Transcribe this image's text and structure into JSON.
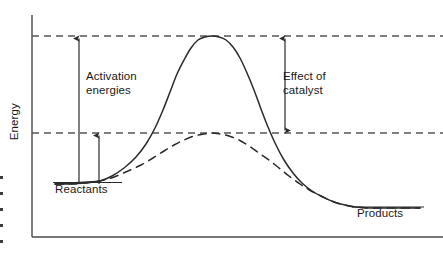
{
  "figure": {
    "kind": "reaction-energy-profile-diagram",
    "background": "#ffffff",
    "stroke_color": "#2b2b2b",
    "dash_color": "#555555"
  },
  "axes": {
    "y_label": "Energy",
    "x_label": "",
    "y_axis_x": 32,
    "y_axis_top": 15,
    "x_axis_y": 237,
    "x_axis_right": 443,
    "ticks": []
  },
  "labels": {
    "activation_energies": "Activation\nenergies",
    "effect_of_catalyst": "Effect of\ncatalyst",
    "reactants": "Reactants",
    "products": "Products",
    "energy": "Energy"
  },
  "levels": {
    "transition_state_uncatalyzed_y": 36,
    "transition_state_catalyzed_y": 133,
    "reactants_y": 184,
    "products_y": 208
  },
  "arrows": [
    {
      "name": "activation-energy-uncatalyzed-arrow",
      "x": 79,
      "y_from": 184,
      "y_to": 36,
      "heads": "up"
    },
    {
      "name": "activation-energy-catalyzed-arrow",
      "x": 99,
      "y_from": 184,
      "y_to": 133,
      "heads": "up"
    },
    {
      "name": "effect-of-catalyst-arrow",
      "x": 285,
      "y_from": 36,
      "y_to": 133,
      "heads": "both"
    }
  ],
  "chart_data": {
    "type": "line",
    "title": "",
    "xlabel": "",
    "ylabel": "Energy",
    "grid": false,
    "legend": null,
    "xlim": [
      32,
      443
    ],
    "ylim_pixels_top_to_bottom": [
      15,
      237
    ],
    "annotations": [
      {
        "text": "Activation energies",
        "x": 86,
        "y": 70
      },
      {
        "text": "Effect of catalyst",
        "x": 283,
        "y": 70
      },
      {
        "text": "Reactants",
        "x": 55,
        "y": 183
      },
      {
        "text": "Products",
        "x": 357,
        "y": 207
      }
    ],
    "reference_lines": [
      {
        "name": "uncatalyzed-transition-state-level",
        "y": 36,
        "style": "dashed",
        "x_from": 32,
        "x_to": 443
      },
      {
        "name": "catalyzed-transition-state-level",
        "y": 133,
        "style": "dashed",
        "x_from": 32,
        "x_to": 443
      }
    ],
    "series": [
      {
        "name": "Uncatalyzed reaction pathway",
        "style": "solid",
        "points": [
          [
            55,
            184
          ],
          [
            70,
            184
          ],
          [
            85,
            183
          ],
          [
            100,
            181
          ],
          [
            112,
            176
          ],
          [
            124,
            168
          ],
          [
            136,
            157
          ],
          [
            146,
            144
          ],
          [
            155,
            128
          ],
          [
            163,
            110
          ],
          [
            170,
            92
          ],
          [
            177,
            74
          ],
          [
            184,
            60
          ],
          [
            191,
            48
          ],
          [
            198,
            40
          ],
          [
            205,
            37
          ],
          [
            212,
            36
          ],
          [
            219,
            37
          ],
          [
            226,
            40
          ],
          [
            233,
            47
          ],
          [
            240,
            58
          ],
          [
            247,
            73
          ],
          [
            254,
            90
          ],
          [
            261,
            109
          ],
          [
            268,
            127
          ],
          [
            276,
            145
          ],
          [
            284,
            160
          ],
          [
            293,
            173
          ],
          [
            302,
            183
          ],
          [
            312,
            191
          ],
          [
            323,
            197
          ],
          [
            334,
            202
          ],
          [
            345,
            205
          ],
          [
            356,
            207
          ],
          [
            370,
            208
          ],
          [
            390,
            208
          ],
          [
            420,
            208
          ]
        ]
      },
      {
        "name": "Catalyzed reaction pathway",
        "style": "dashed",
        "points": [
          [
            55,
            184
          ],
          [
            70,
            184
          ],
          [
            85,
            183
          ],
          [
            100,
            181
          ],
          [
            114,
            177
          ],
          [
            128,
            171
          ],
          [
            141,
            165
          ],
          [
            153,
            158
          ],
          [
            164,
            151
          ],
          [
            174,
            145
          ],
          [
            184,
            140
          ],
          [
            194,
            136
          ],
          [
            204,
            134
          ],
          [
            212,
            133
          ],
          [
            220,
            134
          ],
          [
            229,
            136
          ],
          [
            239,
            140
          ],
          [
            249,
            146
          ],
          [
            259,
            153
          ],
          [
            269,
            160
          ],
          [
            279,
            168
          ],
          [
            289,
            176
          ],
          [
            300,
            184
          ],
          [
            311,
            191
          ],
          [
            323,
            197
          ],
          [
            334,
            202
          ],
          [
            345,
            205
          ],
          [
            356,
            207
          ],
          [
            370,
            208
          ],
          [
            390,
            208
          ],
          [
            420,
            208
          ]
        ]
      }
    ]
  }
}
